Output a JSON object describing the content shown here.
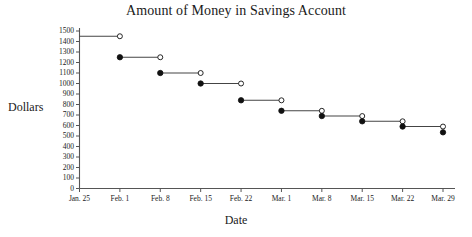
{
  "chart_data": {
    "type": "line",
    "subtype": "step-function",
    "title": "Amount of Money in Savings Account",
    "xlabel": "Date",
    "ylabel": "Dollars",
    "grid": false,
    "legend": null,
    "categories": [
      "Jan. 25",
      "Feb. 1",
      "Feb. 8",
      "Feb. 15",
      "Feb. 22",
      "Mar. 1",
      "Mar. 8",
      "Mar. 15",
      "Mar. 22",
      "Mar. 29"
    ],
    "x_tick_labels": [
      "Jan. 25",
      "Feb. 1",
      "Feb. 8",
      "Feb. 15",
      "Feb. 22",
      "Mar. 1",
      "Mar. 8",
      "Mar. 15",
      "Mar. 22",
      "Mar. 29"
    ],
    "y_tick_labels": [
      "0",
      "100",
      "200",
      "300",
      "400",
      "500",
      "600",
      "700",
      "800",
      "900",
      "1000",
      "1100",
      "1200",
      "1300",
      "1400",
      "1500"
    ],
    "y_tick_values": [
      0,
      100,
      200,
      300,
      400,
      500,
      600,
      700,
      800,
      900,
      1000,
      1100,
      1200,
      1300,
      1400,
      1500
    ],
    "ylim": [
      0,
      1500
    ],
    "y_tick_step": 100,
    "segments": [
      {
        "x_start": "Jan. 25",
        "x_end": "Feb. 1",
        "value": 1450,
        "left_marker": "none",
        "right_marker": "open"
      },
      {
        "x_start": "Feb. 1",
        "x_end": "Feb. 8",
        "value": 1250,
        "left_marker": "filled",
        "right_marker": "open"
      },
      {
        "x_start": "Feb. 8",
        "x_end": "Feb. 15",
        "value": 1100,
        "left_marker": "filled",
        "right_marker": "open"
      },
      {
        "x_start": "Feb. 15",
        "x_end": "Feb. 22",
        "value": 1000,
        "left_marker": "filled",
        "right_marker": "open"
      },
      {
        "x_start": "Feb. 22",
        "x_end": "Mar. 1",
        "value": 840,
        "left_marker": "filled",
        "right_marker": "open"
      },
      {
        "x_start": "Mar. 1",
        "x_end": "Mar. 8",
        "value": 740,
        "left_marker": "filled",
        "right_marker": "open"
      },
      {
        "x_start": "Mar. 8",
        "x_end": "Mar. 15",
        "value": 690,
        "left_marker": "filled",
        "right_marker": "open"
      },
      {
        "x_start": "Mar. 15",
        "x_end": "Mar. 22",
        "value": 640,
        "left_marker": "filled",
        "right_marker": "open"
      },
      {
        "x_start": "Mar. 22",
        "x_end": "Mar. 29",
        "value": 590,
        "left_marker": "filled",
        "right_marker": "open"
      },
      {
        "x_start": "Mar. 29",
        "x_end": "Mar. 29",
        "value": 535,
        "left_marker": "filled",
        "right_marker": "none"
      }
    ],
    "colors": {
      "line": "#444444",
      "marker_fill": "#111111",
      "marker_open_fill": "#ffffff",
      "marker_stroke": "#111111",
      "axis": "#555555",
      "text": "#1a1a1a",
      "background": "#ffffff"
    }
  }
}
